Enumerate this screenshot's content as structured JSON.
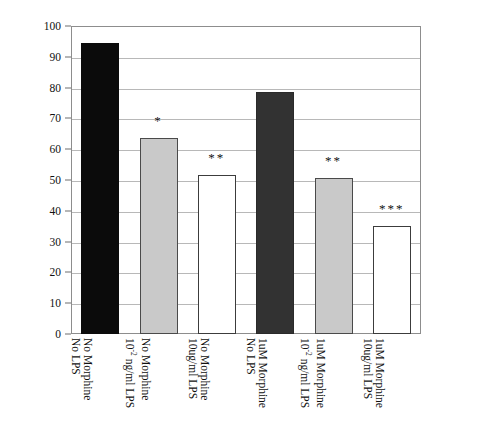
{
  "chart_data": {
    "type": "bar",
    "title": "",
    "xlabel": "",
    "ylabel": "% Cell Viability",
    "ylim": [
      0,
      100
    ],
    "ytick_step": 10,
    "grid": true,
    "legend": "none",
    "categories": [
      "No Morphine\nNo LPS",
      "No Morphine\n10-2 ng/ml LPS",
      "No Morphine\n10ug/ml LPS",
      "1uM Morphine\nNo LPS",
      "1uM Morphine\n10-2 ng/ml LPS",
      "1uM Morphine\n10ug/ml LPS"
    ],
    "values": [
      94.5,
      63.5,
      51.5,
      78.5,
      50.5,
      35.0
    ],
    "bar_colors": [
      "#0b0b0b",
      "#c9c9c9",
      "#ffffff",
      "#323232",
      "#c9c9c9",
      "#ffffff"
    ],
    "annotations": [
      "",
      "*",
      "**",
      "",
      "**",
      "***"
    ]
  },
  "axis": {
    "y_title": "% Cell Viability",
    "y_ticks": [
      "100",
      "90",
      "80",
      "70",
      "60",
      "50",
      "40",
      "30",
      "20",
      "10",
      "0"
    ]
  },
  "bars": [
    {
      "index": 0,
      "value": 94.5,
      "fill": "fill-black",
      "sig": "",
      "label_line1": "No Morphine",
      "label_line2": "No LPS",
      "label_line2_sup": "",
      "label_line2_tail": ""
    },
    {
      "index": 1,
      "value": 63.5,
      "fill": "fill-lightgray",
      "sig": "*",
      "label_line1": "No Morphine",
      "label_line2": "10",
      "label_line2_sup": "-2",
      "label_line2_tail": " ng/ml LPS"
    },
    {
      "index": 2,
      "value": 51.5,
      "fill": "fill-white",
      "sig": "**",
      "label_line1": "No Morphine",
      "label_line2": "10ug/ml LPS",
      "label_line2_sup": "",
      "label_line2_tail": ""
    },
    {
      "index": 3,
      "value": 78.5,
      "fill": "fill-darkgray",
      "sig": "",
      "label_line1": "1uM Morphine",
      "label_line2": "No LPS",
      "label_line2_sup": "",
      "label_line2_tail": ""
    },
    {
      "index": 4,
      "value": 50.5,
      "fill": "fill-lightgray",
      "sig": "**",
      "label_line1": "1uM Morphine",
      "label_line2": "10",
      "label_line2_sup": "-2",
      "label_line2_tail": " ng/ml LPS"
    },
    {
      "index": 5,
      "value": 35.0,
      "fill": "fill-white",
      "sig": "***",
      "label_line1": "1uM Morphine",
      "label_line2": "10ug/ml LPS",
      "label_line2_sup": "",
      "label_line2_tail": ""
    }
  ]
}
